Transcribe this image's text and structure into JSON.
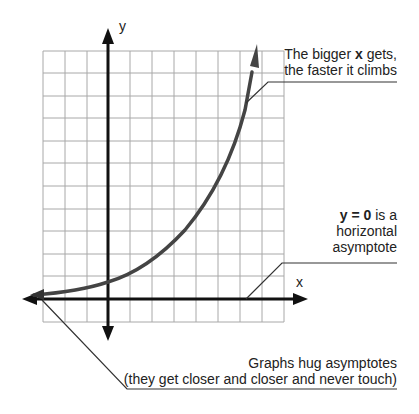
{
  "diagram": {
    "type": "exponential-growth-graph",
    "axes": {
      "x_label": "x",
      "y_label": "y"
    },
    "grid": {
      "columns": 11,
      "rows": 12,
      "color": "#a8a8a8"
    },
    "colors": {
      "axis": "#111111",
      "curve": "#444444",
      "callout_line": "#333333",
      "text": "#222222"
    },
    "annotations": {
      "growth": {
        "line1_prefix": "The bigger ",
        "line1_bold": "x",
        "line1_suffix": " gets,",
        "line2": "the faster it climbs"
      },
      "asymptote": {
        "line1_bold": "y = 0",
        "line1_suffix": " is a",
        "line2": "horizontal",
        "line3": "asymptote"
      },
      "hug": {
        "line1": "Graphs hug asymptotes",
        "line2": "(they get closer and closer and never touch)"
      }
    }
  }
}
